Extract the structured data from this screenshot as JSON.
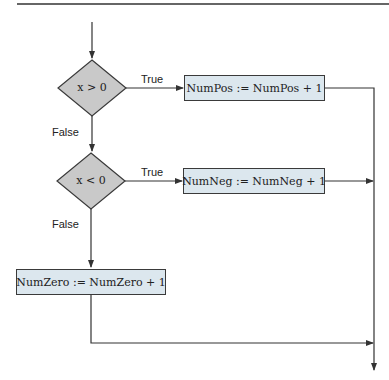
{
  "flowchart": {
    "decisions": [
      {
        "id": "d1",
        "condition": "x > 0",
        "true_label": "True",
        "false_label": "False"
      },
      {
        "id": "d2",
        "condition": "x < 0",
        "true_label": "True",
        "false_label": "False"
      }
    ],
    "processes": [
      {
        "id": "p1",
        "text": "NumPos := NumPos + 1"
      },
      {
        "id": "p2",
        "text": "NumNeg := NumNeg + 1"
      },
      {
        "id": "p3",
        "text": "NumZero := NumZero + 1"
      }
    ],
    "colors": {
      "decision_fill": "#c9c9c9",
      "process_fill": "#dce7ee",
      "stroke": "#3a3a3a"
    }
  }
}
